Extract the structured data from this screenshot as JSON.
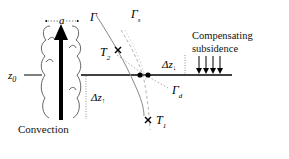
{
  "diagram": {
    "labels": {
      "height_level": "z",
      "height_level_sub": "0",
      "cloud_width": "a",
      "gamma": "Γ",
      "gamma_s": "Γ",
      "gamma_s_sub": "s",
      "gamma_d": "Γ",
      "gamma_d_sub": "d",
      "t2": "T",
      "t2_sub": "2",
      "t1": "T",
      "t1_sub": "1",
      "dz_up": "Δz",
      "dz_up_sub": "↓",
      "dz_down": "Δz",
      "dz_down_sub": "↑",
      "compensating_line1": "Compensating",
      "compensating_line2": "subsidence",
      "convection": "Convection"
    },
    "colors": {
      "line": "#000000",
      "gamma_curve": "#888888",
      "dashed_curve": "#aaaaaa",
      "dotted": "#999999"
    },
    "subsidence_arrow_count": 4
  }
}
